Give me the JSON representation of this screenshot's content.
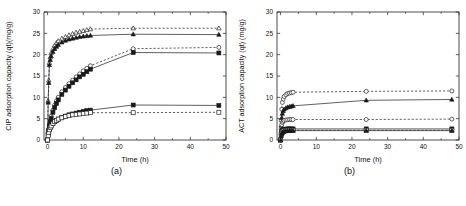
{
  "figure": {
    "panels": [
      {
        "id": "a",
        "caption": "(a)",
        "chart_data": {
          "type": "line",
          "title": "",
          "xlabel": "Time (h)",
          "ylabel": "CIP adsorption capacity (qt)(mg/g)",
          "xlim": [
            -1,
            50
          ],
          "ylim": [
            0,
            30
          ],
          "xticks": [
            0,
            10,
            20,
            30,
            40,
            50
          ],
          "yticks": [
            0,
            5,
            10,
            15,
            20,
            25,
            30
          ],
          "grid": false,
          "legend": "none",
          "series": [
            {
              "name": "open-triangle-dashed",
              "marker": "triangle-open",
              "line": "dashed",
              "x": [
                0,
                0.17,
                0.33,
                0.5,
                0.75,
                1,
                1.5,
                2,
                2.5,
                3,
                4,
                5,
                6,
                7,
                8,
                9,
                10,
                11,
                12,
                24,
                48
              ],
              "y": [
                0,
                9.2,
                14.0,
                18.1,
                19.4,
                20.4,
                21.4,
                22.2,
                22.8,
                23.2,
                23.8,
                24.2,
                24.6,
                24.9,
                25.2,
                25.4,
                25.6,
                25.8,
                26.0,
                26.2,
                26.2
              ]
            },
            {
              "name": "filled-triangle-solid",
              "marker": "triangle-filled",
              "line": "solid",
              "x": [
                0,
                0.17,
                0.33,
                0.5,
                0.75,
                1,
                1.5,
                2,
                2.5,
                3,
                4,
                5,
                6,
                7,
                8,
                9,
                10,
                11,
                12,
                24,
                48
              ],
              "y": [
                0,
                8.8,
                13.4,
                17.6,
                18.8,
                19.7,
                20.7,
                21.4,
                21.9,
                22.3,
                22.9,
                23.3,
                23.6,
                23.8,
                24.0,
                24.2,
                24.3,
                24.4,
                24.5,
                24.8,
                24.7
              ]
            },
            {
              "name": "open-circle-dashed",
              "marker": "circle-open",
              "line": "dashed",
              "x": [
                0,
                0.17,
                0.33,
                0.5,
                0.75,
                1,
                1.5,
                2,
                2.5,
                3,
                4,
                5,
                6,
                7,
                8,
                9,
                10,
                11,
                12,
                24,
                48
              ],
              "y": [
                0,
                1.6,
                2.6,
                3.6,
                4.6,
                5.6,
                7.0,
                8.2,
                9.2,
                10.0,
                11.3,
                12.3,
                13.2,
                14.0,
                14.8,
                15.5,
                16.2,
                16.8,
                17.4,
                21.4,
                21.7
              ]
            },
            {
              "name": "filled-square-mid-solid",
              "marker": "square-filled",
              "line": "solid",
              "x": [
                0,
                0.17,
                0.33,
                0.5,
                0.75,
                1,
                1.5,
                2,
                2.5,
                3,
                4,
                5,
                6,
                7,
                8,
                9,
                10,
                11,
                12,
                24,
                48
              ],
              "y": [
                0,
                1.4,
                2.3,
                3.2,
                4.2,
                5.1,
                6.5,
                7.6,
                8.6,
                9.4,
                10.7,
                11.7,
                12.6,
                13.4,
                14.1,
                14.8,
                15.4,
                16.0,
                16.6,
                20.5,
                20.4
              ]
            },
            {
              "name": "filled-square-low-solid",
              "marker": "square-filled",
              "line": "solid",
              "x": [
                0,
                0.17,
                0.33,
                0.5,
                0.75,
                1,
                1.5,
                2,
                2.5,
                3,
                4,
                5,
                6,
                7,
                8,
                9,
                10,
                11,
                12,
                24,
                48
              ],
              "y": [
                0,
                1.5,
                2.1,
                2.6,
                3.0,
                3.4,
                3.9,
                4.3,
                4.6,
                4.9,
                5.3,
                5.6,
                5.9,
                6.1,
                6.3,
                6.5,
                6.7,
                6.9,
                7.0,
                8.2,
                8.1
              ]
            },
            {
              "name": "open-square-low-dashed",
              "marker": "square-open",
              "line": "dashed",
              "x": [
                0,
                0.17,
                0.33,
                0.5,
                0.75,
                1,
                1.5,
                2,
                2.5,
                3,
                4,
                5,
                6,
                7,
                8,
                9,
                10,
                11,
                12,
                24,
                48
              ],
              "y": [
                0,
                1.0,
                1.8,
                2.4,
                2.9,
                3.3,
                3.9,
                4.3,
                4.6,
                4.9,
                5.2,
                5.5,
                5.7,
                5.9,
                6.0,
                6.1,
                6.2,
                6.3,
                6.4,
                6.4,
                6.5
              ]
            }
          ]
        }
      },
      {
        "id": "b",
        "caption": "(b)",
        "chart_data": {
          "type": "line",
          "title": "",
          "xlabel": "Time (h)",
          "ylabel": "ACT adsorption capacity (qt) (mg/g)",
          "xlim": [
            -1,
            50
          ],
          "ylim": [
            0,
            30
          ],
          "xticks": [
            0,
            10,
            20,
            30,
            40,
            50
          ],
          "yticks": [
            0,
            5,
            10,
            15,
            20,
            25,
            30
          ],
          "grid": false,
          "legend": "none",
          "series": [
            {
              "name": "open-circle-dashed-top",
              "marker": "circle-open",
              "line": "dashed",
              "x": [
                0,
                0.17,
                0.33,
                0.5,
                0.75,
                1,
                1.5,
                2,
                2.5,
                3,
                3.5,
                24,
                48
              ],
              "y": [
                0,
                4.6,
                7.2,
                8.8,
                9.6,
                10.2,
                10.6,
                10.9,
                11.0,
                11.1,
                11.2,
                11.4,
                11.5
              ]
            },
            {
              "name": "filled-triangle-solid",
              "marker": "triangle-filled",
              "line": "solid",
              "x": [
                0,
                0.17,
                0.33,
                0.5,
                0.75,
                1,
                1.5,
                2,
                2.5,
                3,
                3.5,
                24,
                48
              ],
              "y": [
                0,
                3.4,
                5.2,
                6.2,
                6.8,
                7.2,
                7.5,
                7.7,
                7.8,
                7.9,
                8.0,
                9.3,
                9.5
              ]
            },
            {
              "name": "open-circle-dashed-mid",
              "marker": "circle-open",
              "line": "dashed",
              "x": [
                0,
                0.17,
                0.33,
                0.5,
                0.75,
                1,
                1.5,
                2,
                2.5,
                3,
                3.5,
                24,
                48
              ],
              "y": [
                0,
                2.6,
                3.6,
                4.1,
                4.4,
                4.6,
                4.7,
                4.75,
                4.8,
                4.8,
                4.8,
                4.8,
                4.9
              ]
            },
            {
              "name": "filled-square-solid-low",
              "marker": "square-filled",
              "line": "solid",
              "x": [
                0,
                0.17,
                0.33,
                0.5,
                0.75,
                1,
                1.5,
                2,
                2.5,
                3,
                3.5,
                24,
                48
              ],
              "y": [
                0,
                1.6,
                2.1,
                2.3,
                2.45,
                2.5,
                2.55,
                2.6,
                2.6,
                2.6,
                2.6,
                2.6,
                2.6
              ]
            },
            {
              "name": "open-square-dashed-low",
              "marker": "square-open",
              "line": "dashed",
              "x": [
                0,
                0.17,
                0.33,
                0.5,
                0.75,
                1,
                1.5,
                2,
                2.5,
                3,
                3.5,
                24,
                48
              ],
              "y": [
                0,
                1.2,
                1.7,
                2.0,
                2.1,
                2.2,
                2.25,
                2.3,
                2.3,
                2.3,
                2.3,
                2.3,
                2.3
              ]
            },
            {
              "name": "filled-triangle-solid-lowest",
              "marker": "triangle-filled",
              "line": "solid",
              "x": [
                0,
                0.17,
                0.33,
                0.5,
                0.75,
                1,
                1.5,
                2,
                2.5,
                3,
                3.5,
                24,
                48
              ],
              "y": [
                0,
                0.9,
                1.4,
                1.7,
                1.9,
                2.0,
                2.1,
                2.15,
                2.2,
                2.2,
                2.2,
                2.2,
                2.2
              ]
            }
          ]
        }
      }
    ]
  }
}
